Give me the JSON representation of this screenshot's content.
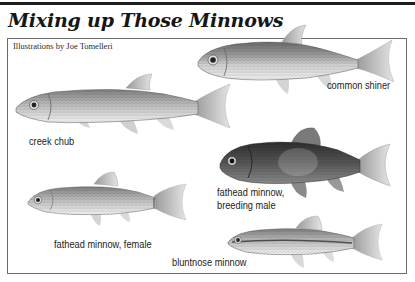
{
  "title": "Mixing up Those Minnows",
  "credit": "Illustrations by Joe Tomelleri",
  "fish": [
    {
      "id": "creek-chub",
      "label": "creek chub"
    },
    {
      "id": "common-shiner",
      "label": "common shiner"
    },
    {
      "id": "fathead-minnow-male",
      "label_line1": "fathead minnow,",
      "label_line2": "breeding male"
    },
    {
      "id": "fathead-minnow-female",
      "label": "fathead minnow, female"
    },
    {
      "id": "bluntnose-minnow",
      "label": "bluntnose minnow"
    }
  ],
  "colors": {
    "rule": "#1e1e1e",
    "frame": "#6a6a6a",
    "text": "#222222"
  }
}
